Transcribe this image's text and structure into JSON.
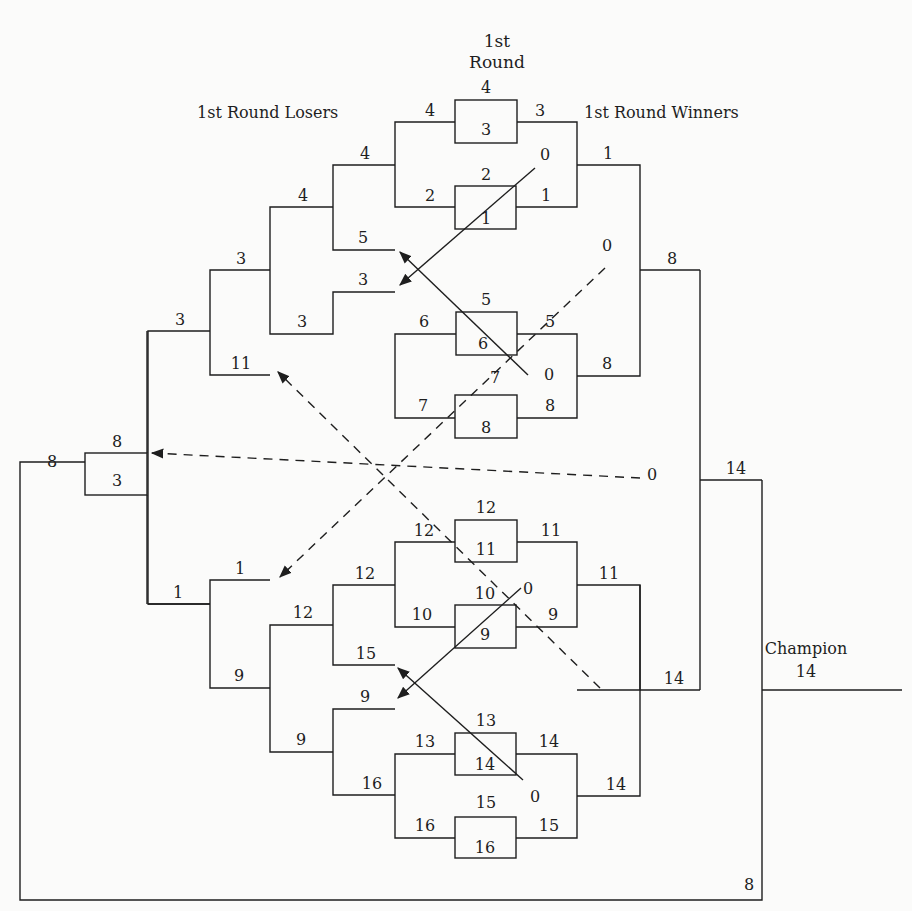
{
  "diagram": {
    "type": "double-elimination-bracket",
    "headings": {
      "first_round_line1": "1st",
      "first_round_line2": "Round",
      "losers": "1st Round Losers",
      "winners": "1st Round Winners",
      "champion_label": "Champion",
      "champion_value": "14"
    },
    "first_round_matches": [
      {
        "top": "4",
        "bottom": "3",
        "left_in": "4",
        "right_out": "3"
      },
      {
        "top": "2",
        "bottom": "1",
        "left_in": "2",
        "right_out": "1"
      },
      {
        "top": "5",
        "bottom": "6",
        "left_in": "6",
        "right_out": "5"
      },
      {
        "top": "7",
        "bottom": "8",
        "left_in": "7",
        "right_out": "8"
      },
      {
        "top": "12",
        "bottom": "11",
        "left_in": "12",
        "right_out": "11"
      },
      {
        "top": "10",
        "bottom": "9",
        "left_in": "10",
        "right_out": "9"
      },
      {
        "top": "13",
        "bottom": "14",
        "left_in": "13",
        "right_out": "14"
      },
      {
        "top": "15",
        "bottom": "16",
        "left_in": "16",
        "right_out": "15"
      }
    ],
    "winners_bracket": {
      "round2": [
        "1",
        "8",
        "11",
        "14"
      ],
      "semis": [
        "8",
        "14"
      ],
      "final": "14"
    },
    "losers_bracket": {
      "upper": {
        "r1": [
          "4",
          "3"
        ],
        "r2_in": [
          "5",
          "3"
        ],
        "r2": [
          "4",
          "3"
        ],
        "r3": "3",
        "r3_in": "11",
        "r4": "3"
      },
      "lower": {
        "r1": [
          "12",
          "9"
        ],
        "r2_in": [
          "15",
          "9"
        ],
        "r2": [
          "12",
          "9"
        ],
        "r3": "9",
        "r3_in": "1",
        "r4": "1"
      },
      "final_box": {
        "top": "8",
        "bottom": "3"
      },
      "final_out": "8",
      "grand_final_in": "8"
    },
    "zero_markers": [
      "0",
      "0",
      "0",
      "0",
      "0",
      "0"
    ]
  }
}
